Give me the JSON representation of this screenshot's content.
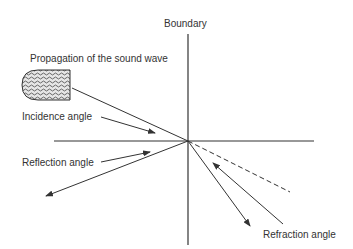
{
  "diagram": {
    "labels": {
      "boundary": "Boundary",
      "propagation": "Propagation of the sound wave",
      "incidence": "Incidence angle",
      "reflection": "Reflection angle",
      "refraction": "Refraction angle"
    },
    "elements": {
      "boundary_line": "vertical boundary line",
      "normal_line": "horizontal line",
      "sound_source": "sound wave transducer (hatched bullet shape)",
      "incident_ray": "incident ray",
      "reflected_ray": "reflected ray with arrowhead",
      "refracted_ray": "refracted ray with arrowhead",
      "continuation_ray": "dashed continuation of incident ray"
    },
    "colors": {
      "line": "#333333",
      "text": "#333333",
      "background": "#ffffff",
      "hatch": "#555555"
    }
  }
}
